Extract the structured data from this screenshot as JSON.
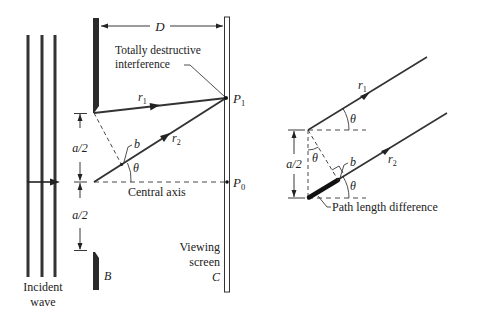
{
  "left_diagram": {
    "distance_label": "D",
    "annotation_destructive_line1": "Totally destructive",
    "annotation_destructive_line2": "interference",
    "ray1": {
      "name": "r",
      "sub": "1"
    },
    "ray2": {
      "name": "r",
      "sub": "2"
    },
    "point_b": "b",
    "angle": "θ",
    "half_width_top": "a/2",
    "half_width_bottom": "a/2",
    "point_p1": {
      "name": "P",
      "sub": "1"
    },
    "point_p0": {
      "name": "P",
      "sub": "0"
    },
    "central_axis": "Central axis",
    "barrier_label": "B",
    "screen_label_line1": "Viewing",
    "screen_label_line2": "screen",
    "screen_label_letter": "C",
    "incident_line1": "Incident",
    "incident_line2": "wave"
  },
  "right_diagram": {
    "ray1": {
      "name": "r",
      "sub": "1"
    },
    "ray2": {
      "name": "r",
      "sub": "2"
    },
    "angle_top": "θ",
    "angle_inner": "θ",
    "angle_bottom": "θ",
    "point_b": "b",
    "half_width": "a/2",
    "path_length_label": "Path length difference"
  },
  "colors": {
    "ink": "#222222",
    "background": "#ffffff"
  }
}
